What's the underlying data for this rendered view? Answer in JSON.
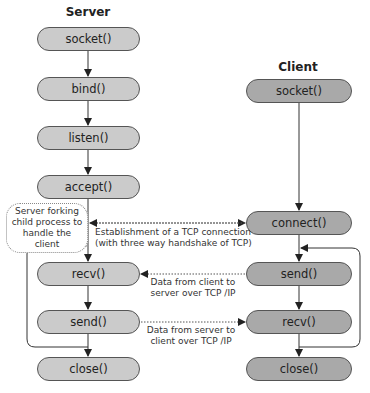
{
  "server": {
    "title": "Server",
    "nodes": [
      "socket()",
      "bind()",
      "listen()",
      "accept()",
      "recv()",
      "send()",
      "close()"
    ]
  },
  "client": {
    "title": "Client",
    "nodes": [
      "socket()",
      "connect()",
      "send()",
      "recv()",
      "close()"
    ]
  },
  "annotations": {
    "fork_note": "Server forking child process to handle the client",
    "tcp_establish_line1": "Establishment of a TCP connection",
    "tcp_establish_line2": "(with three way handshake of TCP)",
    "client_to_server_line1": "Data from client to",
    "client_to_server_line2": "server over TCP /IP",
    "server_to_client_line1": "Data from server to",
    "server_to_client_line2": "client over TCP /IP"
  },
  "colors": {
    "server_node": "#cbcbcb",
    "client_node": "#a9a9a9",
    "line": "#333333"
  }
}
